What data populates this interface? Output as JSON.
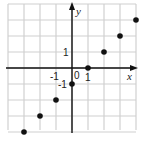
{
  "chart_data": {
    "type": "scatter",
    "title": "",
    "xlabel": "x",
    "ylabel": "y",
    "xlim": [
      -4,
      4
    ],
    "ylim": [
      -4,
      4
    ],
    "grid": true,
    "tick_labels": {
      "x": [
        "-1",
        "0",
        "1"
      ],
      "y": [
        "1",
        "-1"
      ]
    },
    "points": [
      {
        "x": -3,
        "y": -4
      },
      {
        "x": -2,
        "y": -3
      },
      {
        "x": -1,
        "y": -2
      },
      {
        "x": 0,
        "y": -1
      },
      {
        "x": 1,
        "y": 0
      },
      {
        "x": 2,
        "y": 1
      },
      {
        "x": 3,
        "y": 2
      },
      {
        "x": 4,
        "y": 3
      }
    ],
    "colors": {
      "grid": "#d0d0d0",
      "axis": "#111111",
      "point": "#111111"
    }
  },
  "labels": {
    "x_axis": "x",
    "y_axis": "y",
    "origin": "0",
    "x_neg1": "-1",
    "x_pos1": "1",
    "y_pos1": "1",
    "y_neg1": "-1"
  }
}
